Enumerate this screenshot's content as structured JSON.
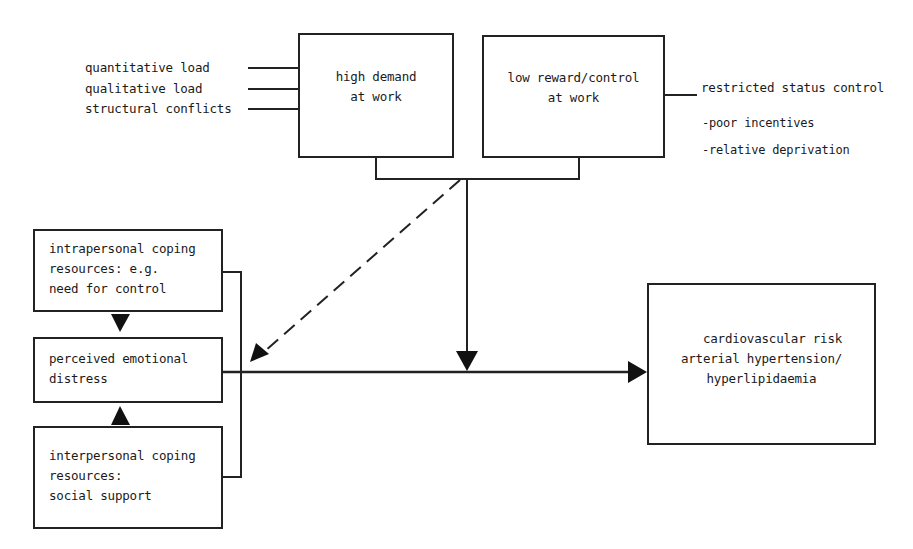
{
  "diagram": {
    "stressors": {
      "demand_inputs": [
        "quantitative load",
        "qualitative load",
        "structural conflicts"
      ],
      "reward_outputs": {
        "main": "restricted status control",
        "sub": [
          "-poor incentives",
          "-relative deprivation"
        ]
      }
    },
    "boxes": {
      "high_demand": [
        "high demand",
        "at work"
      ],
      "low_reward": [
        "low reward/control",
        "at work"
      ],
      "intrapersonal": [
        "intrapersonal coping",
        "resources: e.g.",
        "need for control"
      ],
      "perceived_distress": [
        "perceived emotional",
        "distress"
      ],
      "interpersonal": [
        "interpersonal coping",
        "resources:",
        "social support"
      ],
      "outcome": [
        "cardiovascular risk",
        "arterial hypertension/",
        "hyperlipidaemia"
      ]
    },
    "connectors": {
      "stress_to_distress": "dashed",
      "stress_to_outcome": "solid",
      "distress_to_outcome": "solid"
    },
    "colors": {
      "line": "#222222",
      "background": "#ffffff"
    }
  }
}
